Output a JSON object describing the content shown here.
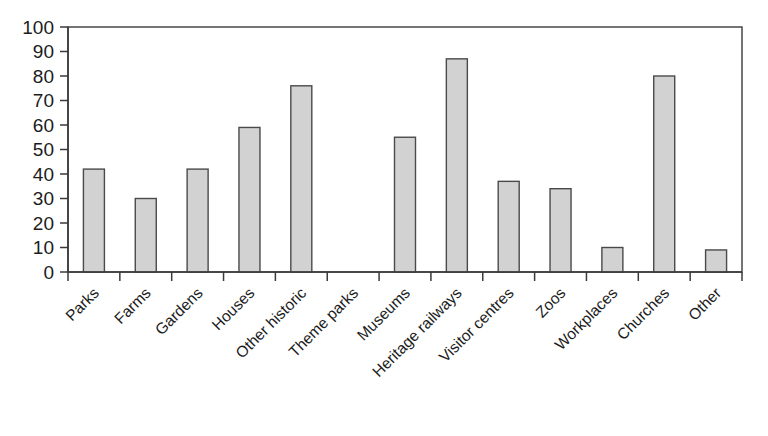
{
  "chart_data": {
    "type": "bar",
    "title": "",
    "subtitle": "",
    "xlabel": "",
    "ylabel": "",
    "ylim": [
      0,
      100
    ],
    "ytick_step": 10,
    "yticks": [
      "0",
      "10",
      "20",
      "30",
      "40",
      "50",
      "60",
      "70",
      "80",
      "90",
      "100"
    ],
    "grid": false,
    "legend": false,
    "legend_position": "none",
    "categories": [
      "Parks",
      "Farms",
      "Gardens",
      "Houses",
      "Other historic",
      "Theme parks",
      "Museums",
      "Heritage railways",
      "Visitor centres",
      "Zoos",
      "Workplaces",
      "Churches",
      "Other"
    ],
    "values": [
      42,
      30,
      42,
      59,
      76,
      0,
      55,
      87,
      37,
      34,
      10,
      80,
      9
    ],
    "annotations": []
  },
  "style": {
    "bar_fill": "#d2d2d2",
    "bar_stroke": "#4a4a4a",
    "axis_color": "#3a3a3a",
    "text_color": "#1c1c1c",
    "background": "#ffffff",
    "label_rotation_deg": -45
  }
}
